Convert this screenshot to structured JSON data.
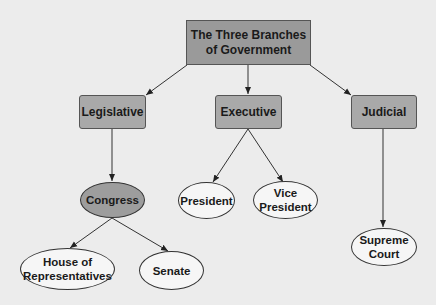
{
  "diagram": {
    "title": "The Three Branches of Government",
    "nodes": {
      "root": {
        "line1": "The Three Branches",
        "line2": "of Government"
      },
      "legislative": {
        "label": "Legislative"
      },
      "executive": {
        "label": "Executive"
      },
      "judicial": {
        "label": "Judicial"
      },
      "congress": {
        "label": "Congress"
      },
      "president": {
        "label": "President"
      },
      "vice_president": {
        "line1": "Vice",
        "line2": "President"
      },
      "house": {
        "line1": "House of",
        "line2": "Representatives"
      },
      "senate": {
        "label": "Senate"
      },
      "supreme_court": {
        "line1": "Supreme",
        "line2": "Court"
      }
    },
    "edges": [
      {
        "from": "root",
        "to": "legislative"
      },
      {
        "from": "root",
        "to": "executive"
      },
      {
        "from": "root",
        "to": "judicial"
      },
      {
        "from": "legislative",
        "to": "congress"
      },
      {
        "from": "executive",
        "to": "president"
      },
      {
        "from": "executive",
        "to": "vice_president"
      },
      {
        "from": "judicial",
        "to": "supreme_court"
      },
      {
        "from": "congress",
        "to": "house"
      },
      {
        "from": "congress",
        "to": "senate"
      }
    ],
    "colors": {
      "background": "#ececec",
      "root_fill": "#9a9a9a",
      "branch_fill": "#a9a9a9",
      "congress_fill": "#9d9d9d",
      "leaf_fill": "#f6f6f6",
      "line": "#333333"
    }
  }
}
